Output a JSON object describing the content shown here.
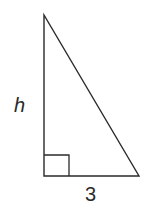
{
  "diagram": {
    "type": "right-triangle",
    "vertices": {
      "top": [
        44,
        15
      ],
      "right_angle": [
        44,
        176
      ],
      "bottom_right": [
        139,
        176
      ]
    },
    "right_angle_marker": {
      "x": 44,
      "y": 155,
      "size_w": 25,
      "size_h": 21
    },
    "labels": {
      "height": "h",
      "base": "3"
    },
    "stroke_color": "#2a2a2a",
    "background": "#ffffff"
  }
}
